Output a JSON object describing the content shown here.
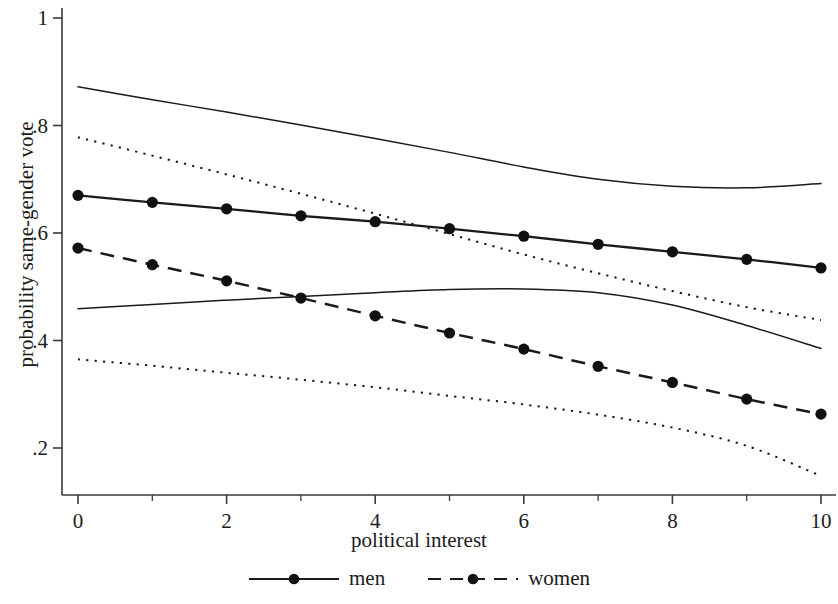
{
  "chart_data": {
    "type": "line",
    "title": "",
    "xlabel": "political interest",
    "ylabel": "probability same-gender vote",
    "xlim": [
      0,
      10
    ],
    "ylim": [
      0.13,
      1.02
    ],
    "grid": false,
    "legend_position": "bottom",
    "x": [
      0,
      1,
      2,
      3,
      4,
      5,
      6,
      7,
      8,
      9,
      10
    ],
    "xticks": [
      "0",
      "2",
      "4",
      "6",
      "8",
      "10"
    ],
    "xtick_values": [
      0,
      2,
      4,
      6,
      8,
      10
    ],
    "xminor_ticks": [
      1,
      3,
      5,
      7,
      9
    ],
    "yticks": [
      ".2",
      ".4",
      ".6",
      ".8",
      "1"
    ],
    "ytick_values": [
      0.2,
      0.4,
      0.6,
      0.8,
      1.0
    ],
    "series": [
      {
        "name": "men",
        "style": "solid-with-markers",
        "color": "#1a1a1a",
        "marker": "filled-circle",
        "values": [
          0.67,
          0.657,
          0.645,
          0.632,
          0.621,
          0.608,
          0.594,
          0.579,
          0.565,
          0.551,
          0.535
        ]
      },
      {
        "name": "women",
        "style": "dashed-with-markers",
        "color": "#1a1a1a",
        "marker": "filled-circle",
        "values": [
          0.572,
          0.541,
          0.511,
          0.479,
          0.446,
          0.414,
          0.384,
          0.352,
          0.322,
          0.291,
          0.263
        ]
      },
      {
        "name": "men upper confidence bound",
        "style": "solid-thin",
        "color": "#1a1a1a",
        "marker": "none",
        "values": [
          0.872,
          0.848,
          0.825,
          0.801,
          0.776,
          0.75,
          0.723,
          0.7,
          0.687,
          0.684,
          0.692
        ]
      },
      {
        "name": "men lower confidence bound",
        "style": "solid-thin",
        "color": "#1a1a1a",
        "marker": "none",
        "values": [
          0.459,
          0.467,
          0.475,
          0.482,
          0.489,
          0.495,
          0.496,
          0.489,
          0.466,
          0.428,
          0.385
        ]
      },
      {
        "name": "women upper confidence bound",
        "style": "dotted-thin",
        "color": "#1a1a1a",
        "marker": "none",
        "values": [
          0.778,
          0.744,
          0.709,
          0.673,
          0.636,
          0.598,
          0.56,
          0.525,
          0.492,
          0.462,
          0.438
        ]
      },
      {
        "name": "women lower confidence bound",
        "style": "dotted-thin",
        "color": "#1a1a1a",
        "marker": "none",
        "values": [
          0.365,
          0.353,
          0.34,
          0.327,
          0.313,
          0.297,
          0.281,
          0.262,
          0.238,
          0.204,
          0.148
        ]
      }
    ]
  },
  "legend": {
    "entries": [
      {
        "label": "men",
        "key": "solid-line-with-dot"
      },
      {
        "label": "women",
        "key": "dashed-line-with-dot"
      }
    ]
  },
  "axes": {
    "x_title": "political interest",
    "y_title": "probability same-gender vote"
  }
}
